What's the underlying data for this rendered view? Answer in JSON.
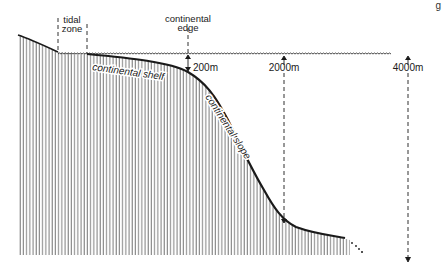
{
  "diagram": {
    "labels": {
      "tidal_zone_line1": "tidal",
      "tidal_zone_line2": "zone",
      "continental_edge_line1": "continental",
      "continental_edge_line2": "edge",
      "continental_shelf": "continental shelf",
      "continental_slope": "continental slope"
    },
    "depth_markers": [
      {
        "label": "200m",
        "x": 188
      },
      {
        "label": "2000m",
        "x": 284
      },
      {
        "label": "4000m",
        "x": 408
      }
    ],
    "corner_mark": "g",
    "colors": {
      "ink": "#1a1a1a",
      "hatch": "#6b6b6b",
      "background": "#ffffff"
    }
  }
}
